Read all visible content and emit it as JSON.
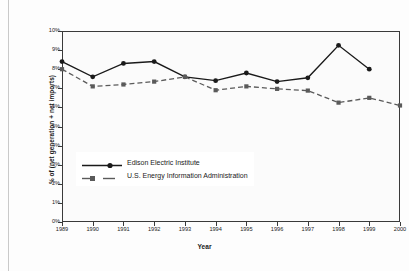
{
  "chart_data": {
    "type": "line",
    "title": "",
    "xlabel": "Year",
    "ylabel": "% of (net generation + net imports)",
    "x": [
      1989,
      1990,
      1991,
      1992,
      1993,
      1994,
      1995,
      1996,
      1997,
      1998,
      1999,
      2000
    ],
    "xtick_labels": [
      "1989",
      "1990",
      "1991",
      "1992",
      "1993",
      "1994",
      "1995",
      "1996",
      "1997",
      "1998",
      "1999",
      "2000"
    ],
    "ytick_labels": [
      "0%",
      "1%",
      "2%",
      "3%",
      "4%",
      "5%",
      "6%",
      "7%",
      "8%",
      "9%",
      "10%"
    ],
    "ytick_values": [
      0,
      1,
      2,
      3,
      4,
      5,
      6,
      7,
      8,
      9,
      10
    ],
    "ylim": [
      0,
      10
    ],
    "xlim": [
      1989,
      2000
    ],
    "grid": false,
    "legend_position": "center-left",
    "series": [
      {
        "name": "Edison Electric Institute",
        "marker": "circle",
        "linestyle": "solid",
        "color": "#1a1a1a",
        "x": [
          1989,
          1990,
          1991,
          1992,
          1993,
          1994,
          1995,
          1996,
          1997,
          1998,
          1999
        ],
        "values": [
          8.4,
          7.6,
          8.3,
          8.4,
          7.6,
          7.4,
          7.8,
          7.35,
          7.55,
          9.25,
          8.0
        ]
      },
      {
        "name": "U.S. Energy Information Administration",
        "marker": "square",
        "linestyle": "dashed",
        "color": "#5a5a5a",
        "x": [
          1989,
          1990,
          1991,
          1992,
          1993,
          1994,
          1995,
          1996,
          1997,
          1998,
          1999,
          2000
        ],
        "values": [
          8.0,
          7.1,
          7.2,
          7.35,
          7.6,
          6.9,
          7.1,
          6.97,
          6.88,
          6.25,
          6.5,
          6.1
        ]
      }
    ]
  },
  "legend": {
    "items": [
      {
        "label": "Edison Electric Institute"
      },
      {
        "label": "U.S. Energy Information Administration"
      }
    ]
  }
}
